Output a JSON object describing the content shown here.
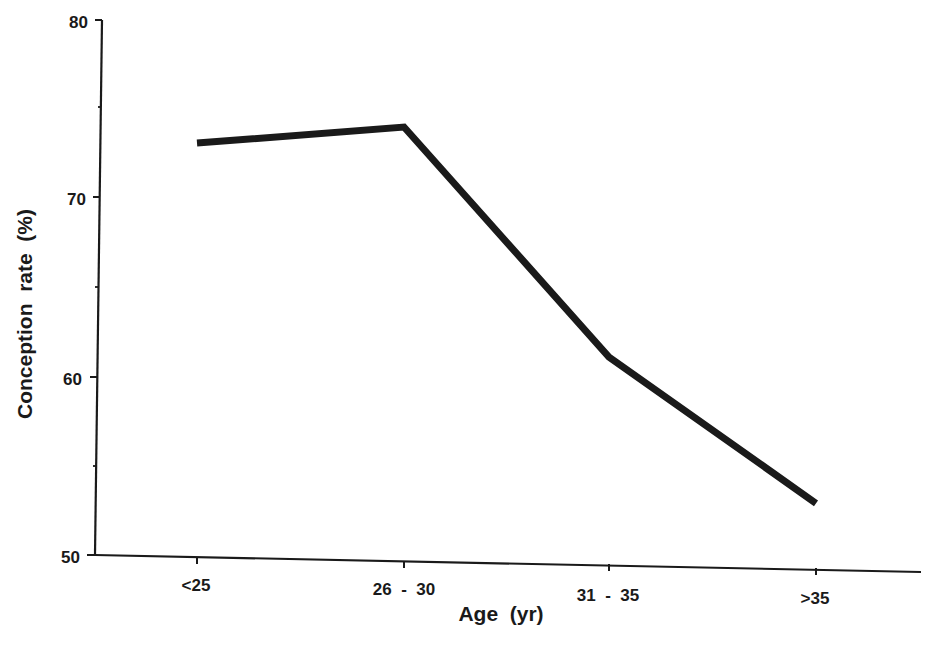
{
  "chart_data": {
    "type": "line",
    "title": "",
    "xlabel": "Age  (yr)",
    "ylabel": "Conception  rate  (%)",
    "categories": [
      "<25",
      "26  -  30",
      "31  -  35",
      ">35"
    ],
    "series": [
      {
        "name": "Conception rate",
        "values": [
          73.1,
          74.0,
          61.1,
          52.9
        ],
        "color": "#1a1a1a"
      }
    ],
    "ylim": [
      50,
      80
    ],
    "yticks": [
      50,
      60,
      70,
      80
    ],
    "yticks_minor": [
      55,
      65,
      75
    ],
    "grid": false,
    "legend": "none"
  },
  "axis": {
    "y_tick_labels": [
      "80",
      "70",
      "60",
      "50"
    ],
    "x_tick_labels": [
      "<25",
      "26  -  30",
      "31  -  35",
      ">35"
    ],
    "x_title": "Age  (yr)",
    "y_title": "Conception  rate  (%)"
  }
}
